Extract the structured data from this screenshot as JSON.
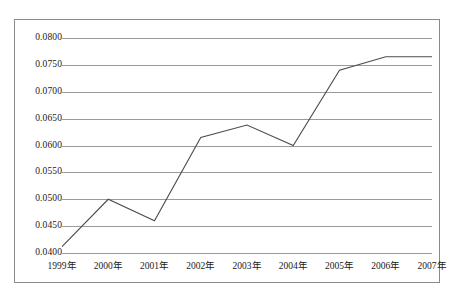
{
  "chart_data": {
    "type": "line",
    "title": "",
    "subtitle": "",
    "xlabel": "",
    "ylabel": "",
    "categories": [
      "1999年",
      "2000年",
      "2001年",
      "2002年",
      "2003年",
      "2004年",
      "2005年",
      "2006年",
      "2007年"
    ],
    "values": [
      0.0412,
      0.05,
      0.046,
      0.0615,
      0.0638,
      0.06,
      0.074,
      0.0765,
      0.0765
    ],
    "series": [
      {
        "name": "",
        "values": [
          0.0412,
          0.05,
          0.046,
          0.0615,
          0.0638,
          0.06,
          0.074,
          0.0765,
          0.0765
        ]
      }
    ],
    "ylim": [
      0.04,
      0.08
    ],
    "ytick_labels": [
      "0.0800",
      "0.0750",
      "0.0700",
      "0.0650",
      "0.0600",
      "0.0550",
      "0.0500",
      "0.0450",
      "0.0400"
    ],
    "ytick_values": [
      0.08,
      0.075,
      0.07,
      0.065,
      0.06,
      0.055,
      0.05,
      0.045,
      0.04
    ],
    "grid": true,
    "grid_axis": "y",
    "legend": false,
    "legend_position": "none",
    "line_color": "#4d4d4d",
    "grid_color": "#9a9a9a",
    "frame_color": "#8a8a8a",
    "background_color": "#ffffff",
    "annotations": []
  }
}
